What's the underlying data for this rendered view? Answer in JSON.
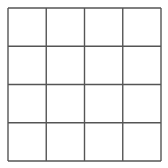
{
  "grid": {
    "rows": 4,
    "cols": 4,
    "origin_x": 8,
    "origin_y": 8,
    "size": 153,
    "line_color": "#555555",
    "line_width": 1.4,
    "background": "#ffffff",
    "cells": [
      [
        "",
        "",
        "",
        ""
      ],
      [
        "",
        "",
        "",
        ""
      ],
      [
        "",
        "",
        "",
        ""
      ],
      [
        "",
        "",
        "",
        ""
      ]
    ]
  }
}
